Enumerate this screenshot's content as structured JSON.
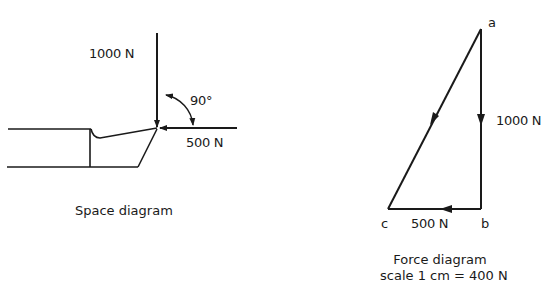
{
  "space_diagram": {
    "caption": "Space diagram",
    "vertical_force_label": "1000 N",
    "horizontal_force_label": "500 N",
    "angle_label": "90°"
  },
  "force_diagram": {
    "caption_line1": "Force diagram",
    "caption_line2": "scale 1 cm = 400 N",
    "point_a": "a",
    "point_b": "b",
    "point_c": "c",
    "ab_label": "1000 N",
    "bc_label": "500 N"
  },
  "colors": {
    "ink": "#1a1a1a",
    "background": "#ffffff"
  }
}
